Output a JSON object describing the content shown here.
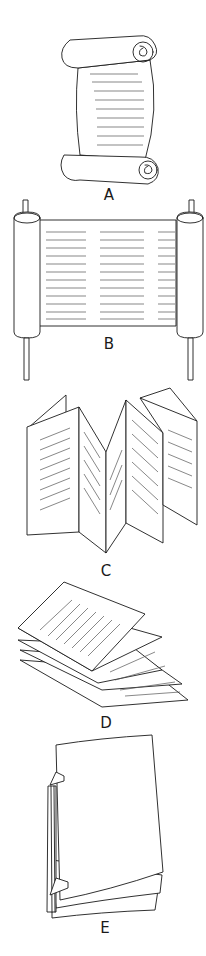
{
  "figure": {
    "panels": [
      {
        "id": "A",
        "label": "A",
        "depicts": "hand-held scroll with curled ends"
      },
      {
        "id": "B",
        "label": "B",
        "depicts": "scroll on two rollers"
      },
      {
        "id": "C",
        "label": "C",
        "depicts": "accordion-folded book"
      },
      {
        "id": "D",
        "label": "D",
        "depicts": "stack of folded sheets"
      },
      {
        "id": "E",
        "label": "E",
        "depicts": "stitch-bound book"
      }
    ]
  },
  "colors": {
    "line": "#1a1a1a",
    "text_lines": "#555555",
    "background": "#ffffff"
  }
}
